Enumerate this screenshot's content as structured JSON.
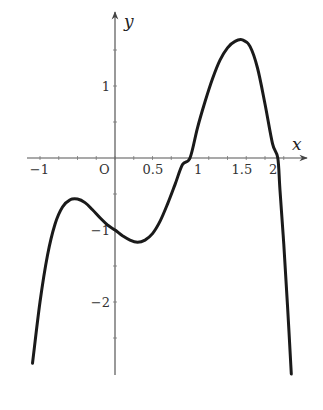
{
  "chart_data": {
    "type": "line",
    "title": "",
    "xlabel": "x",
    "ylabel": "y",
    "origin_label": "O",
    "xlim": [
      -1.2,
      2.55
    ],
    "ylim": [
      -3.05,
      2.0
    ],
    "grid": false,
    "x_ticks": [
      {
        "value": -1,
        "label": "-1"
      },
      {
        "value": 0.5,
        "label": "0.5"
      },
      {
        "value": 1,
        "label": "1"
      },
      {
        "value": 1.5,
        "label": "1.5"
      },
      {
        "value": 2,
        "label": "2"
      }
    ],
    "y_ticks": [
      {
        "value": 1,
        "label": "1"
      },
      {
        "value": -1,
        "label": "-1"
      },
      {
        "value": -2,
        "label": "-2"
      }
    ],
    "series": [
      {
        "name": "f(x)",
        "color": "#1a1a1a",
        "x": [
          -1.1,
          -1.0,
          -0.9,
          -0.8,
          -0.7,
          -0.6,
          -0.5,
          -0.4,
          -0.3,
          -0.2,
          -0.1,
          0.0,
          0.1,
          0.2,
          0.3,
          0.4,
          0.5,
          0.6,
          0.7,
          0.8,
          0.9,
          1.0,
          1.1,
          1.2,
          1.3,
          1.4,
          1.5,
          1.6,
          1.7,
          1.8,
          1.9,
          2.0,
          2.1,
          2.17,
          2.2,
          2.25,
          2.3,
          2.35
        ],
        "y": [
          -2.85,
          -2.0,
          -1.35,
          -0.92,
          -0.68,
          -0.58,
          -0.57,
          -0.62,
          -0.72,
          -0.83,
          -0.93,
          -1.0,
          -1.08,
          -1.14,
          -1.17,
          -1.14,
          -1.05,
          -0.88,
          -0.64,
          -0.37,
          -0.09,
          0.0,
          0.42,
          0.78,
          1.1,
          1.36,
          1.53,
          1.62,
          1.64,
          1.55,
          1.25,
          0.75,
          0.2,
          0.0,
          -0.45,
          -1.2,
          -2.05,
          -3.0
        ]
      }
    ]
  },
  "layout": {
    "origin_px": [
      115,
      158
    ],
    "px_per_unit_x": 75,
    "px_per_unit_y": 72,
    "x_axis_px": [
      27,
      307
    ],
    "y_axis_px": [
      375,
      12
    ]
  }
}
